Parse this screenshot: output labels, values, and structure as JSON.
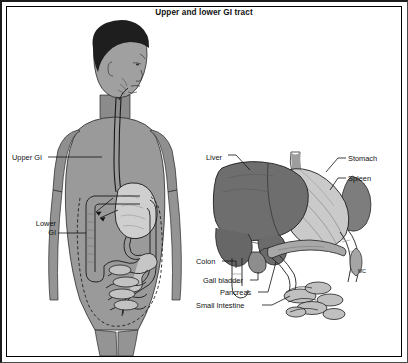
{
  "figure": {
    "title": "Upper and lower GI tract",
    "domain_type": "anatomical-diagram",
    "background_color": "#ffffff",
    "frame_color": "#000000",
    "text_color": "#111111"
  },
  "palette": {
    "skin": "#9a9a9a",
    "skin_shadow": "#838383",
    "skin_light": "#b0b0b0",
    "hair": "#1e1e1e",
    "liver": "#6e6e6e",
    "liver_dark": "#5a5a5a",
    "stomach": "#c9c9c9",
    "stomach_light": "#d8d8d8",
    "intestine": "#b8b8b8",
    "intestine_light": "#cccccc",
    "pancreas": "#a8a8a8",
    "spleen": "#7d7d7d",
    "outline": "#222222",
    "leader_line": "#111111",
    "dashed_outline": "#1a1a1a"
  },
  "panels": {
    "left": {
      "name": "human-body-gi-overview",
      "labels": [
        {
          "id": "upper-gi",
          "text": "Upper GI",
          "x": 12,
          "y": 153,
          "align": "left"
        },
        {
          "id": "lower-gi",
          "line1": "Lower",
          "line2": "GI",
          "x": 32,
          "y": 219,
          "align": "right"
        }
      ]
    },
    "right": {
      "name": "abdominal-organs-detail",
      "labels": [
        {
          "id": "liver",
          "text": "Liver",
          "x": 206,
          "y": 153
        },
        {
          "id": "stomach",
          "text": "Stomach",
          "x": 348,
          "y": 154
        },
        {
          "id": "spleen",
          "text": "Spleen",
          "x": 348,
          "y": 174
        },
        {
          "id": "colon",
          "text": "Colon",
          "x": 196,
          "y": 257
        },
        {
          "id": "gall-bladder",
          "text": "Gall bladder",
          "x": 203,
          "y": 279
        },
        {
          "id": "pancreas",
          "text": "Pancreas",
          "x": 220,
          "y": 291
        },
        {
          "id": "small-intestine",
          "text": "Small Intestine",
          "x": 196,
          "y": 304
        },
        {
          "id": "mc",
          "text": "MC",
          "x": 358,
          "y": 267
        }
      ]
    }
  },
  "legend_note": {
    "upper_gi_description": "Upper GI tract: esophagus, stomach, duodenum",
    "lower_gi_description": "Lower GI tract: small intestine and colon"
  }
}
